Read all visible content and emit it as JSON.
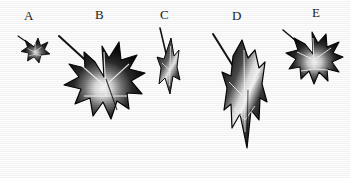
{
  "figure": {
    "background_color": "#fefefe",
    "ink_color": "#111111",
    "vein_color": "#f2f2f2",
    "caption_font_color": "#1a1a1a",
    "specimen_count": 5
  },
  "labels": [
    {
      "text": "A",
      "x": 24,
      "y": 9
    },
    {
      "text": "B",
      "x": 95,
      "y": 8
    },
    {
      "text": "C",
      "x": 160,
      "y": 8
    },
    {
      "text": "D",
      "x": 232,
      "y": 9
    },
    {
      "text": "E",
      "x": 312,
      "y": 6
    }
  ],
  "specimens": [
    {
      "id": "A",
      "name": "leaf-a",
      "description": "very small five-lobed ivy leaf with thin petiole angled up-left",
      "lobes": 5,
      "x": 14,
      "y": 30,
      "width": 40,
      "height": 34,
      "petiole": {
        "from_x": 4,
        "from_y": 6,
        "to_x": 20,
        "to_y": 17,
        "width": 1.1
      }
    },
    {
      "id": "B",
      "name": "leaf-b",
      "description": "largest five-lobed ivy leaf, broad laterals, long petiole to upper left",
      "lobes": 5,
      "x": 57,
      "y": 24,
      "width": 92,
      "height": 100,
      "petiole": {
        "from_x": 2,
        "from_y": 12,
        "to_x": 47,
        "to_y": 52,
        "width": 2.0
      }
    },
    {
      "id": "C",
      "name": "leaf-c",
      "description": "narrow elongated juvenile leaf, slender lobes, petiole nearly vertical",
      "lobes": 3,
      "x": 146,
      "y": 26,
      "width": 42,
      "height": 72,
      "petiole": {
        "from_x": 14,
        "from_y": 2,
        "to_x": 23,
        "to_y": 36,
        "width": 1.6
      }
    },
    {
      "id": "D",
      "name": "leaf-d",
      "description": "long pendant lance-shaped leaf with pointed terminal lobe, petiole up-left",
      "lobes": 3,
      "x": 203,
      "y": 28,
      "width": 76,
      "height": 128,
      "petiole": {
        "from_x": 10,
        "from_y": 6,
        "to_x": 44,
        "to_y": 60,
        "width": 2.0
      }
    },
    {
      "id": "E",
      "name": "leaf-e",
      "description": "medium five-lobed ivy leaf with petiole to upper left",
      "lobes": 5,
      "x": 281,
      "y": 24,
      "width": 66,
      "height": 62,
      "petiole": {
        "from_x": 2,
        "from_y": 6,
        "to_x": 31,
        "to_y": 30,
        "width": 1.6
      }
    }
  ]
}
